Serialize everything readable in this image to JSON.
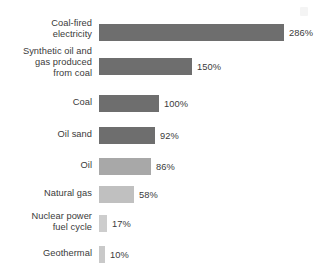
{
  "chart_data": {
    "type": "bar",
    "orientation": "horizontal",
    "title": "",
    "xlabel": "",
    "ylabel": "",
    "xlim": [
      0,
      286
    ],
    "grid": false,
    "legend": null,
    "categories": [
      "Coal-fired\nelectricity",
      "Synthetic oil and\ngas produced\nfrom coal",
      "Coal",
      "Oil sand",
      "Oil",
      "Natural gas",
      "Nuclear power\nfuel cycle",
      "Geothermal"
    ],
    "values": [
      286,
      150,
      100,
      92,
      86,
      58,
      17,
      10
    ],
    "value_labels": [
      "286%",
      "150%",
      "100%",
      "92%",
      "86%",
      "58%",
      "17%",
      "10%"
    ],
    "bar_colors": [
      "#6e6e6e",
      "#6e6e6e",
      "#6e6e6e",
      "#6e6e6e",
      "#a8a8a8",
      "#c0c0c0",
      "#cdcdcd",
      "#c9c9c9"
    ]
  },
  "layout": {
    "row_tops": [
      24,
      58,
      95,
      127,
      158,
      186,
      215,
      246
    ],
    "bar_widths": [
      185,
      93,
      60,
      56,
      52,
      35,
      8,
      6
    ],
    "label_tops": [
      18,
      46,
      97,
      129,
      160,
      188,
      211,
      248
    ]
  }
}
